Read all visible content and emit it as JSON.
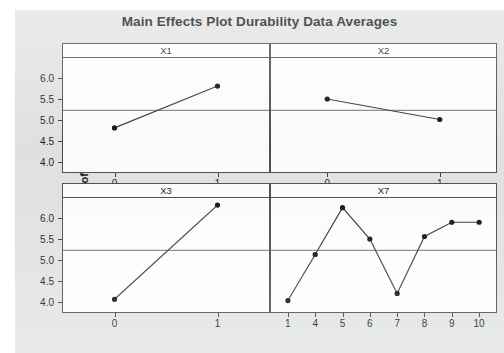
{
  "chart_data": {
    "type": "line",
    "title": "Main Effects Plot Durability Data Averages",
    "xlabel": "",
    "ylabel": "Mean of Durability",
    "ylim": [
      3.75,
      6.45
    ],
    "yticks": [
      "6.0",
      "5.5",
      "5.0",
      "4.5",
      "4.0"
    ],
    "ytick_values": [
      6.0,
      5.5,
      5.0,
      4.5,
      4.0
    ],
    "grid": false,
    "legend_position": "none",
    "reference_line": 5.2,
    "panels": [
      {
        "name": "X1",
        "categories": [
          "0",
          "1"
        ],
        "x": [
          0,
          1
        ],
        "values": [
          4.78,
          5.78
        ],
        "row": 0,
        "col": 0
      },
      {
        "name": "X2",
        "categories": [
          "0",
          "1"
        ],
        "x": [
          0,
          1
        ],
        "values": [
          5.47,
          4.98
        ],
        "row": 0,
        "col": 1
      },
      {
        "name": "X3",
        "categories": [
          "0",
          "1"
        ],
        "x": [
          0,
          1
        ],
        "values": [
          4.03,
          6.28
        ],
        "row": 1,
        "col": 0
      },
      {
        "name": "X7",
        "categories": [
          "1",
          "4",
          "5",
          "6",
          "7",
          "8",
          "9",
          "10"
        ],
        "x": [
          1,
          4,
          5,
          6,
          7,
          8,
          9,
          10
        ],
        "values": [
          4.0,
          5.1,
          6.22,
          5.47,
          4.17,
          5.53,
          5.87,
          5.87
        ],
        "row": 1,
        "col": 1
      }
    ]
  },
  "colors": {
    "background": "#e3e4e4",
    "panel": "#ffffff",
    "line": "#3a3a3a",
    "marker": "#111111",
    "reference_line": "#6e6e6e",
    "axis": "#4d4d4d",
    "text": "#1b1b1b"
  }
}
